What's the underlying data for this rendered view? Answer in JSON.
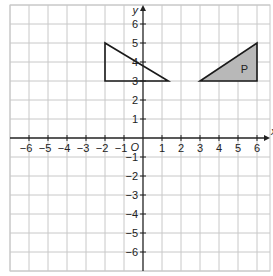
{
  "diagram": {
    "type": "coordinate-grid",
    "x_axis_label": "x",
    "y_axis_label": "y",
    "origin_label": "O",
    "x_range": [
      -7,
      6
    ],
    "y_range": [
      -7,
      7
    ],
    "x_ticks": [
      "-6",
      "-5",
      "-4",
      "-3",
      "-2",
      "-1",
      "1",
      "2",
      "3",
      "4",
      "5",
      "6"
    ],
    "y_ticks": [
      "6",
      "5",
      "4",
      "3",
      "2",
      "1",
      "-1",
      "-2",
      "-3",
      "-4",
      "-5",
      "-6"
    ],
    "shapes": [
      {
        "name": "unlabelled-triangle",
        "label": "",
        "vertices": [
          [
            -2,
            5
          ],
          [
            -2,
            3
          ],
          [
            1.33,
            3
          ]
        ],
        "fill": "none"
      },
      {
        "name": "triangle-P",
        "label": "P",
        "vertices": [
          [
            3,
            3
          ],
          [
            6,
            3
          ],
          [
            6,
            5
          ]
        ],
        "fill": "#b8b8b8"
      }
    ],
    "colors": {
      "grid": "#c8c8c8",
      "axis": "#222222",
      "shape_stroke": "#1a1a1a",
      "shaded_fill": "#b8b8b8"
    }
  }
}
